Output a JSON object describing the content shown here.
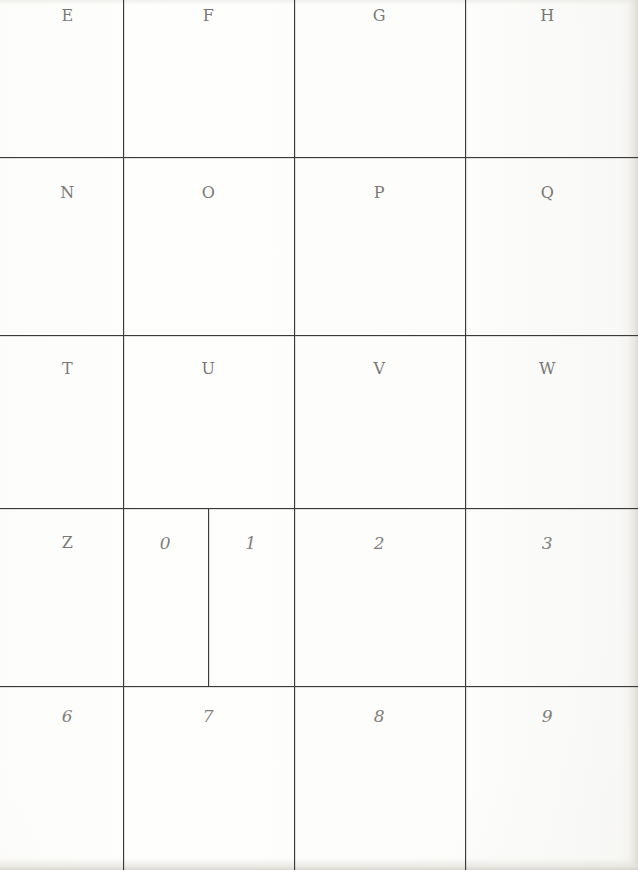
{
  "sheet": {
    "title": "handwriting-practice-grid",
    "width": 638,
    "height": 870,
    "background_color": "#fdfdfc",
    "ink_color": "#5d5b59",
    "rule_color": "#3a3a3a"
  },
  "grid": {
    "vertical_rule_x": [
      123,
      294,
      465
    ],
    "horizontal_rule_y": [
      157,
      335,
      508,
      686
    ],
    "extra_divider": {
      "x": 208,
      "y_start": 508,
      "y_end": 686,
      "row_index": 3
    },
    "columns": 4,
    "rows": 5
  },
  "rows": [
    {
      "index": 0,
      "y": 8,
      "cells": [
        {
          "label": "E",
          "kind": "letter",
          "x": 12,
          "w": 111
        },
        {
          "label": "F",
          "kind": "letter",
          "x": 123,
          "w": 171
        },
        {
          "label": "G",
          "kind": "letter",
          "x": 294,
          "w": 171
        },
        {
          "label": "H",
          "kind": "letter",
          "x": 465,
          "w": 165
        }
      ]
    },
    {
      "index": 1,
      "y": 185,
      "cells": [
        {
          "label": "N",
          "kind": "letter",
          "x": 12,
          "w": 111
        },
        {
          "label": "O",
          "kind": "letter",
          "x": 123,
          "w": 171
        },
        {
          "label": "P",
          "kind": "letter",
          "x": 294,
          "w": 171
        },
        {
          "label": "Q",
          "kind": "letter",
          "x": 465,
          "w": 165
        }
      ]
    },
    {
      "index": 2,
      "y": 361,
      "cells": [
        {
          "label": "T",
          "kind": "letter",
          "x": 12,
          "w": 111
        },
        {
          "label": "U",
          "kind": "letter",
          "x": 123,
          "w": 171
        },
        {
          "label": "V",
          "kind": "letter",
          "x": 294,
          "w": 171
        },
        {
          "label": "W",
          "kind": "letter",
          "x": 465,
          "w": 165
        }
      ]
    },
    {
      "index": 3,
      "y": 535,
      "cells": [
        {
          "label": "Z",
          "kind": "letter",
          "x": 12,
          "w": 111
        },
        {
          "label": "0",
          "kind": "digit",
          "x": 123,
          "w": 85
        },
        {
          "label": "1",
          "kind": "digit",
          "x": 208,
          "w": 86
        },
        {
          "label": "2",
          "kind": "digit",
          "x": 294,
          "w": 171
        },
        {
          "label": "3",
          "kind": "digit",
          "x": 465,
          "w": 165
        }
      ]
    },
    {
      "index": 4,
      "y": 708,
      "cells": [
        {
          "label": "6",
          "kind": "digit",
          "x": 12,
          "w": 111
        },
        {
          "label": "7",
          "kind": "digit",
          "x": 123,
          "w": 171
        },
        {
          "label": "8",
          "kind": "digit",
          "x": 294,
          "w": 171
        },
        {
          "label": "9",
          "kind": "digit",
          "x": 465,
          "w": 165
        }
      ]
    }
  ]
}
